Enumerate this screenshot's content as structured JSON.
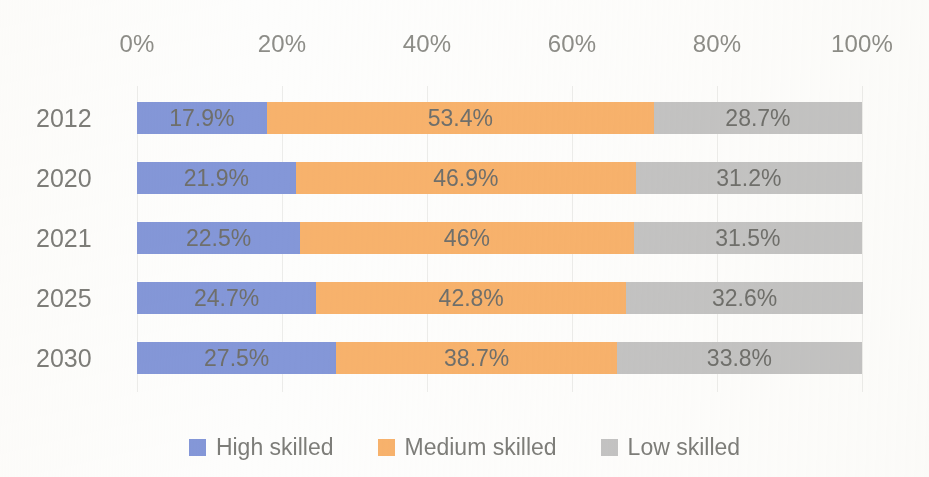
{
  "chart_data": {
    "type": "bar",
    "orientation": "horizontal",
    "stacked": true,
    "normalized_percent": true,
    "title": "",
    "subtitle": "",
    "xlabel": "",
    "ylabel": "",
    "xlim": [
      0,
      100
    ],
    "grid": true,
    "axis_position": "top",
    "legend_position": "bottom",
    "categories": [
      "2012",
      "2020",
      "2021",
      "2025",
      "2030"
    ],
    "xticks": [
      "0%",
      "20%",
      "40%",
      "60%",
      "80%",
      "100%"
    ],
    "xtick_values": [
      0,
      20,
      40,
      60,
      80,
      100
    ],
    "series": [
      {
        "name": "High skilled",
        "color": "#8497D8",
        "values": [
          17.9,
          21.9,
          22.5,
          24.7,
          27.5
        ],
        "labels": [
          "17.9%",
          "21.9%",
          "22.5%",
          "24.7%",
          "27.5%"
        ]
      },
      {
        "name": "Medium skilled",
        "color": "#F7B26C",
        "values": [
          53.4,
          46.9,
          46.0,
          42.8,
          38.7
        ],
        "labels": [
          "53.4%",
          "46.9%",
          "46%",
          "42.8%",
          "38.7%"
        ]
      },
      {
        "name": "Low skilled",
        "color": "#C3C3C3",
        "values": [
          28.7,
          31.2,
          31.5,
          32.6,
          33.8
        ],
        "labels": [
          "28.7%",
          "31.2%",
          "31.5%",
          "32.6%",
          "33.8%"
        ]
      }
    ]
  },
  "style": {
    "background": "#fdfdfc",
    "text_color": "#7d7d79",
    "tick_color": "#8d8d88",
    "datalabel_color": "#6f6f6b",
    "gridline_color": "#ececea"
  },
  "geometry": {
    "plot_left": 137,
    "plot_right": 862,
    "plot_width": 725,
    "first_row_top": 102,
    "row_pitch": 60,
    "bar_height": 32
  }
}
